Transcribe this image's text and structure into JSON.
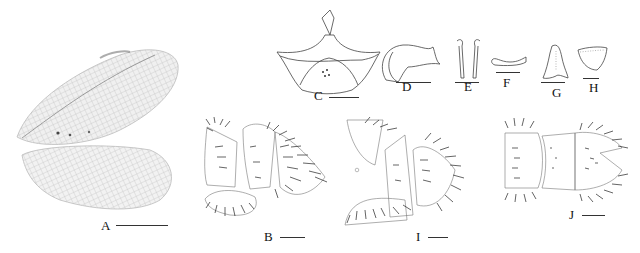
{
  "figure": {
    "panels": [
      {
        "id": "A",
        "label": "A",
        "subject": "forewing and hindwing",
        "style": "photograph, grayscale"
      },
      {
        "id": "B",
        "label": "B",
        "subject": "male terminalia, lateral view",
        "style": "line drawing"
      },
      {
        "id": "C",
        "label": "C",
        "subject": "gonarcus complex, dorsal view",
        "style": "line drawing"
      },
      {
        "id": "D",
        "label": "D",
        "subject": "gonarcus, lateral view",
        "style": "line drawing"
      },
      {
        "id": "E",
        "label": "E",
        "subject": "paired sclerites",
        "style": "line drawing"
      },
      {
        "id": "F",
        "label": "F",
        "subject": "sclerite, lateral",
        "style": "line drawing"
      },
      {
        "id": "G",
        "label": "G",
        "subject": "sclerite",
        "style": "line drawing"
      },
      {
        "id": "H",
        "label": "H",
        "subject": "sclerite",
        "style": "line drawing"
      },
      {
        "id": "I",
        "label": "I",
        "subject": "female terminalia, lateral view",
        "style": "line drawing"
      },
      {
        "id": "J",
        "label": "J",
        "subject": "terminalia, ventral view",
        "style": "line drawing"
      }
    ]
  }
}
